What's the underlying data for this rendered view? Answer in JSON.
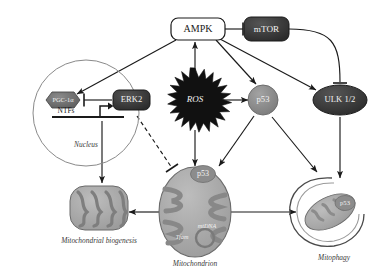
{
  "figure": {
    "background": "#ffffff"
  },
  "nodes": {
    "ampk": {
      "label": "AMPK",
      "shape": "rounded-rect",
      "fill": "#ffffff",
      "stroke": "#1a1a1a",
      "text_color": "#1a1a1a"
    },
    "mtor": {
      "label": "mTOR",
      "shape": "rounded-rect",
      "fill": "#3d3d3d",
      "stroke": "#1a1a1a",
      "text_color": "#f2f2f2"
    },
    "ros": {
      "label": "ROS",
      "shape": "starburst",
      "fill": "#111111",
      "text_color": "#f2f2f2"
    },
    "p53": {
      "label": "p53",
      "shape": "circle",
      "fill": "#8c8c8c",
      "stroke": "#5a5a5a",
      "text_color": "#f2f2f2"
    },
    "ulk": {
      "label": "ULK 1/2",
      "shape": "ellipse",
      "fill": "#3d3d3d",
      "stroke": "#1a1a1a",
      "text_color": "#e8e8e8"
    },
    "erk2": {
      "label": "ERK2",
      "shape": "rounded-rect",
      "fill": "#2e2e2e",
      "stroke": "#1a1a1a",
      "text_color": "#f2f2f2"
    },
    "pgc1a": {
      "label": "PGC-1α",
      "shape": "hexagon",
      "fill": "#6e6e6e",
      "stroke": "#4a4a4a",
      "text_color": "#efefef"
    },
    "ntfs": {
      "label": "NTFs",
      "shape": "text",
      "text_color": "#1a1a1a"
    },
    "mito_p53": {
      "label": "p53",
      "shape": "badge",
      "fill": "#7d7d7d",
      "text_color": "#f2f2f2"
    },
    "mtdna": {
      "label": "mtDNA",
      "shape": "text",
      "text_color": "#f2f2f2"
    },
    "tfam": {
      "label": "Tfam",
      "shape": "text",
      "text_color": "#f2f2f2"
    },
    "mitophagy_p53": {
      "label": "p53",
      "shape": "badge",
      "fill": "#7d7d7d",
      "text_color": "#f2f2f2"
    }
  },
  "compartments": {
    "nucleus": {
      "label": "Nucleus",
      "shape": "circle",
      "stroke": "#8a8a8a"
    },
    "mitochondrion": {
      "label": "Mitochondrion",
      "shape": "organelle",
      "fill": "#a9a9a9",
      "stroke": "#6a6a6a"
    },
    "biogenesis": {
      "label": "Mitochondrial biogenesis",
      "shape": "organelle",
      "fill": "#a9a9a9",
      "stroke": "#6a6a6a"
    },
    "mitophagy": {
      "label": "Mitophagy",
      "shape": "phagophore",
      "fill": "#b5b5b5",
      "stroke": "#555555"
    }
  },
  "edges": [
    {
      "id": "ampk-mtor",
      "from": "ampk",
      "to": "mtor",
      "type": "inhibition",
      "style": "solid"
    },
    {
      "id": "ros-ampk",
      "from": "ros",
      "to": "ampk",
      "type": "activation",
      "style": "solid"
    },
    {
      "id": "ampk-pgc1a",
      "from": "ampk",
      "to": "pgc1a",
      "type": "activation",
      "style": "solid"
    },
    {
      "id": "ampk-p53",
      "from": "ampk",
      "to": "p53",
      "type": "activation",
      "style": "solid"
    },
    {
      "id": "ampk-ulk",
      "from": "ampk",
      "to": "ulk",
      "type": "activation",
      "style": "solid"
    },
    {
      "id": "mtor-ulk",
      "from": "mtor",
      "to": "ulk",
      "type": "inhibition",
      "style": "solid-curved"
    },
    {
      "id": "erk2-pgc1a",
      "from": "erk2",
      "to": "pgc1a",
      "type": "inhibition",
      "style": "solid"
    },
    {
      "id": "ros-p53",
      "from": "ros",
      "to": "p53",
      "type": "activation",
      "style": "solid"
    },
    {
      "id": "ros-mitochondrion",
      "from": "ros",
      "to": "mitochondrion",
      "type": "activation",
      "style": "solid"
    },
    {
      "id": "erk2-mitochondrion",
      "from": "erk2",
      "to": "mitochondrion",
      "type": "inhibition",
      "style": "dashed"
    },
    {
      "id": "p53-mitochondrion",
      "from": "p53",
      "to": "mitochondrion",
      "type": "activation",
      "style": "solid"
    },
    {
      "id": "p53-mitophagy",
      "from": "p53",
      "to": "mitophagy",
      "type": "activation",
      "style": "solid"
    },
    {
      "id": "ulk-mitophagy",
      "from": "ulk",
      "to": "mitophagy",
      "type": "activation",
      "style": "solid"
    },
    {
      "id": "nucleus-biogenesis",
      "from": "nucleus",
      "to": "biogenesis",
      "type": "activation",
      "style": "solid"
    },
    {
      "id": "mitochondrion-biogenesis",
      "from": "mitochondrion",
      "to": "biogenesis",
      "type": "activation",
      "style": "solid"
    },
    {
      "id": "mitochondrion-mitophagy",
      "from": "mitochondrion",
      "to": "mitophagy",
      "type": "activation",
      "style": "solid"
    }
  ]
}
